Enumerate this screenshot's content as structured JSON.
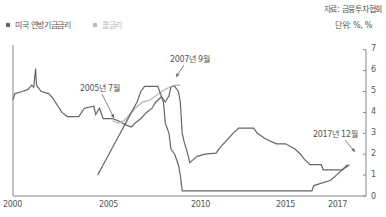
{
  "source": "자료: 금융투자협회",
  "unit": "단위: %, %",
  "legend": [
    {
      "label": "미국 연방기금금리",
      "color": "#666666"
    },
    {
      "label": "콜금리",
      "color": "#bbbbbb"
    }
  ],
  "annotations": [
    {
      "label": "2005년 7월"
    },
    {
      "label": "2007년 9월"
    },
    {
      "label": "2017년 12월"
    }
  ],
  "xaxis": {
    "ticks": [
      "2000",
      "2005",
      "2010",
      "2015",
      "2017"
    ]
  },
  "yaxis": {
    "ticks": [
      "0",
      "1",
      "2",
      "3",
      "4",
      "5",
      "6",
      "7"
    ]
  },
  "chart_data": {
    "type": "line",
    "title": "",
    "xlabel": "",
    "ylabel": "%",
    "ylim": [
      0,
      7
    ],
    "xlim": [
      2000,
      2018.3
    ],
    "grid": false,
    "legend_position": "top-left",
    "series": [
      {
        "name": "미국 연방기금금리",
        "color": "#666666",
        "points": [
          [
            2000.0,
            4.6
          ],
          [
            2000.1,
            4.9
          ],
          [
            2000.5,
            5.0
          ],
          [
            2000.8,
            5.1
          ],
          [
            2001.0,
            5.3
          ],
          [
            2001.1,
            5.2
          ],
          [
            2001.2,
            6.1
          ],
          [
            2001.25,
            5.3
          ],
          [
            2001.5,
            5.0
          ],
          [
            2001.9,
            4.9
          ],
          [
            2002.1,
            4.7
          ],
          [
            2002.6,
            4.0
          ],
          [
            2002.9,
            3.8
          ],
          [
            2003.5,
            3.8
          ],
          [
            2003.8,
            4.2
          ],
          [
            2004.3,
            4.3
          ],
          [
            2004.4,
            3.9
          ],
          [
            2004.6,
            4.2
          ],
          [
            2004.8,
            3.7
          ],
          [
            2005.3,
            3.7
          ],
          [
            2005.6,
            3.6
          ],
          [
            2006.0,
            3.4
          ],
          [
            2006.3,
            3.3
          ],
          [
            2006.5,
            3.5
          ],
          [
            2006.8,
            3.7
          ],
          [
            2007.1,
            4.0
          ],
          [
            2007.4,
            4.2
          ],
          [
            2007.6,
            4.5
          ],
          [
            2007.9,
            4.75
          ],
          [
            2008.1,
            4.5
          ],
          [
            2008.3,
            4.8
          ],
          [
            2008.4,
            5.2
          ],
          [
            2008.5,
            5.25
          ],
          [
            2008.6,
            5.25
          ],
          [
            2008.8,
            5.0
          ],
          [
            2008.9,
            4.5
          ],
          [
            2009.0,
            3.0
          ],
          [
            2009.1,
            2.6
          ],
          [
            2009.3,
            2.0
          ],
          [
            2009.4,
            1.6
          ],
          [
            2009.6,
            1.75
          ],
          [
            2009.8,
            1.9
          ],
          [
            2010.2,
            2.0
          ],
          [
            2010.8,
            2.05
          ],
          [
            2011.0,
            2.3
          ],
          [
            2011.4,
            2.7
          ],
          [
            2011.7,
            3.0
          ],
          [
            2012.0,
            3.25
          ],
          [
            2012.8,
            3.25
          ],
          [
            2013.0,
            3.0
          ],
          [
            2013.4,
            2.75
          ],
          [
            2014.0,
            2.5
          ],
          [
            2014.5,
            2.5
          ],
          [
            2015.0,
            2.25
          ],
          [
            2015.3,
            2.0
          ],
          [
            2015.5,
            1.75
          ],
          [
            2015.8,
            1.5
          ],
          [
            2016.4,
            1.5
          ],
          [
            2016.5,
            1.25
          ],
          [
            2017.5,
            1.25
          ],
          [
            2017.8,
            1.5
          ]
        ]
      },
      {
        "name": "콜금리",
        "color": "#bbbbbb",
        "points": [
          [
            2005.3,
            3.6
          ],
          [
            2005.6,
            3.5
          ],
          [
            2005.9,
            3.6
          ],
          [
            2006.2,
            3.9
          ],
          [
            2006.5,
            4.2
          ],
          [
            2006.9,
            4.5
          ],
          [
            2007.3,
            4.6
          ],
          [
            2007.6,
            4.8
          ],
          [
            2007.9,
            5.0
          ],
          [
            2008.1,
            5.1
          ],
          [
            2008.4,
            5.25
          ],
          [
            2008.6,
            5.3
          ],
          [
            2008.9,
            5.3
          ]
        ]
      },
      {
        "name": "미국 연방기금금리 (2004-2009 step)",
        "color": "#666666",
        "points": [
          [
            2004.5,
            1.0
          ],
          [
            2004.8,
            1.5
          ],
          [
            2005.1,
            2.0
          ],
          [
            2005.4,
            2.5
          ],
          [
            2005.7,
            3.0
          ],
          [
            2006.0,
            3.5
          ],
          [
            2006.3,
            4.0
          ],
          [
            2006.6,
            4.5
          ],
          [
            2006.8,
            5.0
          ],
          [
            2007.0,
            5.25
          ],
          [
            2007.7,
            5.25
          ],
          [
            2007.8,
            5.0
          ],
          [
            2008.0,
            4.5
          ],
          [
            2008.1,
            3.5
          ],
          [
            2008.3,
            3.0
          ],
          [
            2008.4,
            2.25
          ],
          [
            2008.6,
            2.0
          ],
          [
            2008.8,
            1.5
          ],
          [
            2008.9,
            1.0
          ],
          [
            2009.0,
            0.25
          ],
          [
            2015.9,
            0.25
          ],
          [
            2016.0,
            0.5
          ],
          [
            2016.9,
            0.75
          ],
          [
            2017.2,
            1.0
          ],
          [
            2017.5,
            1.25
          ],
          [
            2017.9,
            1.5
          ]
        ]
      }
    ],
    "annotations": [
      {
        "text": "2005년 7월",
        "x": 2005.6,
        "y": 3.6
      },
      {
        "text": "2007년 9월",
        "x": 2007.7,
        "y": 5.2
      },
      {
        "text": "2017년 12월",
        "x": 2017.9,
        "y": 1.5
      }
    ]
  }
}
